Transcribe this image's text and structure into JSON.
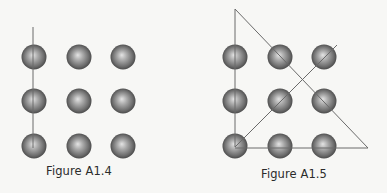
{
  "figures": [
    {
      "id": "A1.4",
      "caption": "Figure A1.4",
      "grid": {
        "rows": 3,
        "cols": 3,
        "col_x": [
          34,
          79,
          123
        ],
        "row_y": [
          57,
          101,
          146
        ],
        "radius": 12.5
      },
      "lines": [
        {
          "x1": 33,
          "y1": 27,
          "x2": 33,
          "y2": 148
        }
      ]
    },
    {
      "id": "A1.5",
      "caption": "Figure A1.5",
      "grid": {
        "rows": 3,
        "cols": 3,
        "col_x": [
          235,
          280,
          324
        ],
        "row_y": [
          57,
          101,
          146
        ],
        "radius": 12.5
      },
      "lines": [
        {
          "x1": 235,
          "y1": 9,
          "x2": 235,
          "y2": 147
        },
        {
          "x1": 235,
          "y1": 9,
          "x2": 368,
          "y2": 148
        },
        {
          "x1": 235,
          "y1": 148,
          "x2": 368,
          "y2": 148
        },
        {
          "x1": 235,
          "y1": 147,
          "x2": 337,
          "y2": 45
        }
      ]
    }
  ],
  "colors": {
    "background": "#f7f7f5",
    "line": "#6a6a6a",
    "sphere_highlight": "#e2e2e2",
    "sphere_mid": "#8a8a8a",
    "sphere_edge": "#3e3e3e",
    "caption_text": "#2b2b2b"
  }
}
